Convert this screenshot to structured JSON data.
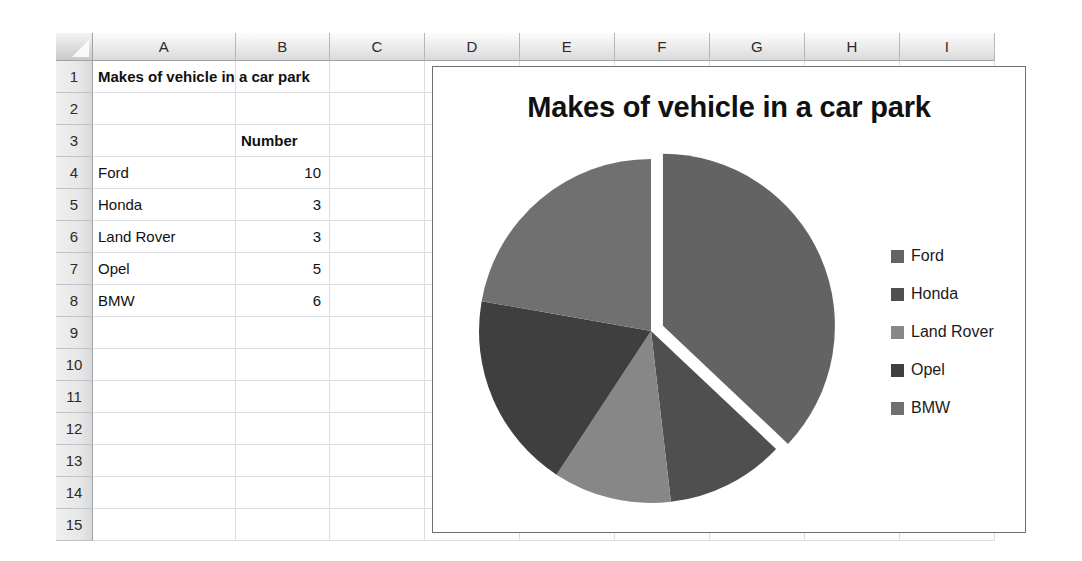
{
  "spreadsheet": {
    "columns": [
      "A",
      "B",
      "C",
      "D",
      "E",
      "F",
      "G",
      "H",
      "I"
    ],
    "rows": [
      "1",
      "2",
      "3",
      "4",
      "5",
      "6",
      "7",
      "8",
      "9",
      "10",
      "11",
      "12",
      "13",
      "14",
      "15"
    ],
    "cells": {
      "A1": "Makes of vehicle in a car park",
      "B3": "Number",
      "A4": "Ford",
      "B4": "10",
      "A5": "Honda",
      "B5": "3",
      "A6": "Land Rover",
      "B6": "3",
      "A7": "Opel",
      "B7": "5",
      "A8": "BMW",
      "B8": "6"
    }
  },
  "chart_data": {
    "type": "pie",
    "title": "Makes of vehicle in a car park",
    "categories": [
      "Ford",
      "Honda",
      "Land Rover",
      "Opel",
      "BMW"
    ],
    "values": [
      10,
      3,
      3,
      5,
      6
    ],
    "total": 27,
    "colors": [
      "#636363",
      "#4f4f4f",
      "#878787",
      "#3f3f3f",
      "#707070"
    ],
    "exploded": [
      "Ford"
    ],
    "legend_position": "right",
    "grid": false,
    "xlabel": "",
    "ylabel": ""
  }
}
